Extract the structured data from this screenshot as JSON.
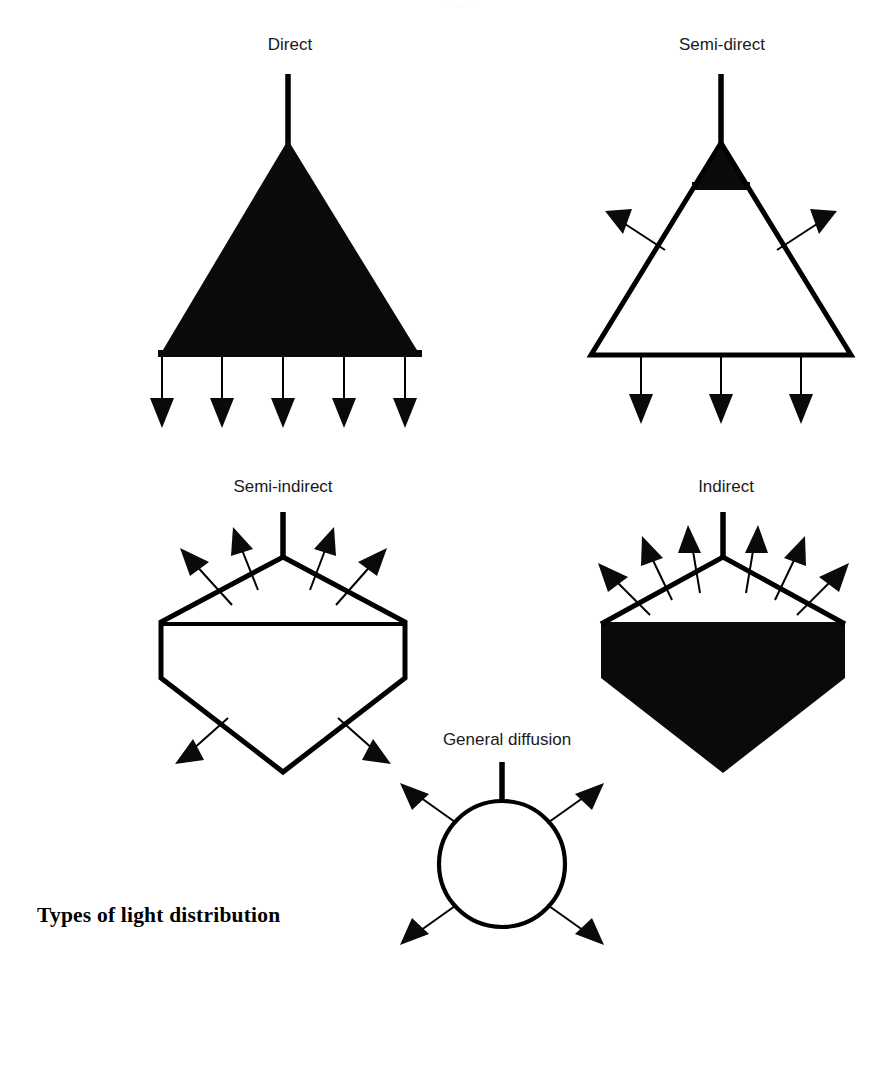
{
  "page": {
    "title": "Types of light distribution",
    "background_color": "#ffffff",
    "ink_color": "#000000",
    "width": 876,
    "height": 1069,
    "top_cropped_text": "........."
  },
  "diagrams": [
    {
      "id": "direct",
      "label": "Direct",
      "label_x": 290,
      "label_y": 50,
      "shape": "filled-triangle",
      "fill": "solid-black",
      "upward_rays": 0,
      "downward_rays": 5,
      "description": "Fully shielded luminaire sending all light downward"
    },
    {
      "id": "semi-direct",
      "label": "Semi-direct",
      "label_x": 722,
      "label_y": 50,
      "shape": "outline-triangle-black-cap",
      "fill": "outline-with-black-top",
      "upward_rays": 2,
      "downward_rays": 3,
      "description": "Mostly downward light with small upward component"
    },
    {
      "id": "semi-indirect",
      "label": "Semi-indirect",
      "label_x": 283,
      "label_y": 492,
      "shape": "outline-diamond",
      "fill": "outline",
      "upward_rays": 4,
      "downward_rays": 2,
      "description": "Mostly upward light with small downward component"
    },
    {
      "id": "indirect",
      "label": "Indirect",
      "label_x": 726,
      "label_y": 492,
      "shape": "diamond-black-lower",
      "fill": "black-below-waist",
      "upward_rays": 6,
      "downward_rays": 0,
      "description": "All light directed upward to the ceiling"
    },
    {
      "id": "general-diffusion",
      "label": "General diffusion",
      "label_x": 507,
      "label_y": 745,
      "shape": "circle",
      "fill": "outline",
      "upward_rays": 2,
      "downward_rays": 2,
      "description": "Light emitted roughly equally in all directions"
    }
  ]
}
